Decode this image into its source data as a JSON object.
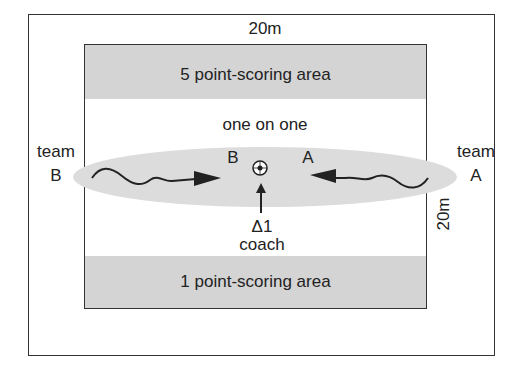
{
  "diagram": {
    "width_label": "20m",
    "height_label": "20m",
    "top_area": "5 point-scoring area",
    "bottom_area": "1 point-scoring area",
    "center_label": "one on one",
    "team_left": {
      "line1": "team",
      "line2": "B"
    },
    "team_right": {
      "line1": "team",
      "line2": "A"
    },
    "player_left": "B",
    "player_right": "A",
    "coach_marker": "Δ1",
    "coach_label": "coach",
    "icons": [
      "soccer-ball-icon",
      "arrow-right-icon",
      "arrow-left-icon",
      "arrow-up-icon"
    ],
    "colors": {
      "band": "#d4d4d4",
      "ellipse": "#dcdcdc",
      "line": "#222222"
    }
  }
}
